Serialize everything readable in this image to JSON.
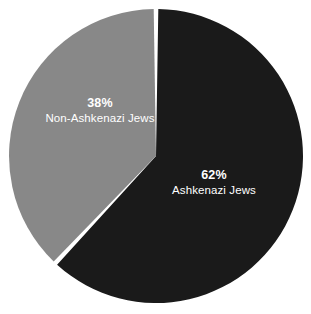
{
  "chart_data": {
    "type": "pie",
    "title": "",
    "subtitle": "",
    "xlabel": "",
    "ylabel": "",
    "legend_position": "none",
    "grid": false,
    "labels_inside_slices": true,
    "start_angle_deg": 0,
    "background_color": "#ffffff",
    "separator_color": "#ffffff",
    "categories": [
      "Ashkenazi Jews",
      "Non-Ashkenazi Jews"
    ],
    "values": [
      62,
      38
    ],
    "units": "percent",
    "slices": [
      {
        "label": "Ashkenazi Jews",
        "value": 62,
        "percent_text": "62%",
        "color": "#1a1a1a",
        "text_color": "#ffffff",
        "direction": "clockwise-from-top"
      },
      {
        "label": "Non-Ashkenazi Jews",
        "value": 38,
        "percent_text": "38%",
        "color": "#888888",
        "text_color": "#ffffff",
        "direction": "counterclockwise-from-top"
      }
    ]
  },
  "geometry": {
    "center_x": 156,
    "center_y": 156,
    "radius": 147
  }
}
